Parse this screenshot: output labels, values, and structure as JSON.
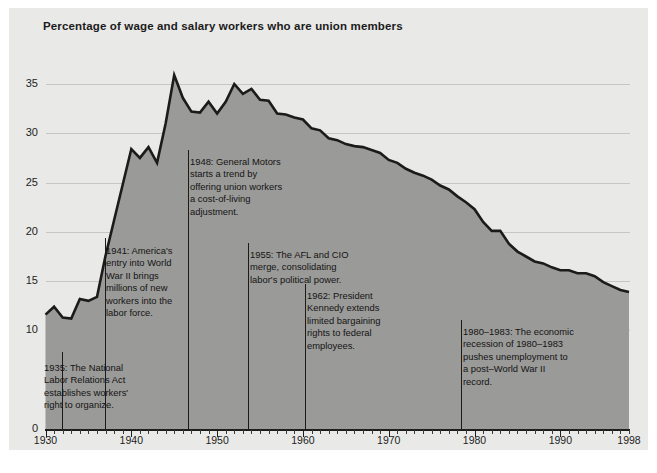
{
  "chart_data": {
    "type": "area",
    "title": "Percentage of wage and salary workers who are union members",
    "xlabel": "",
    "ylabel": "",
    "xlim": [
      1930,
      1998
    ],
    "ylim": [
      0,
      37
    ],
    "yticks": [
      0,
      10,
      15,
      20,
      25,
      30,
      35
    ],
    "ytick_labels": [
      "0",
      "10",
      "15",
      "20",
      "25",
      "30",
      "35"
    ],
    "xticks": [
      1930,
      1940,
      1950,
      1960,
      1970,
      1980,
      1990,
      1998
    ],
    "xtick_labels": [
      "1930",
      "1940",
      "1950",
      "1960",
      "1970",
      "1980",
      "1990",
      "1998"
    ],
    "grid": true,
    "legend": "none",
    "series_name": "Percent of wage and salary workers who are union members",
    "x": [
      1930,
      1931,
      1932,
      1933,
      1934,
      1935,
      1936,
      1937,
      1938,
      1939,
      1940,
      1941,
      1942,
      1943,
      1944,
      1945,
      1946,
      1947,
      1948,
      1949,
      1950,
      1951,
      1952,
      1953,
      1954,
      1955,
      1956,
      1957,
      1958,
      1959,
      1960,
      1961,
      1962,
      1963,
      1964,
      1965,
      1966,
      1967,
      1968,
      1969,
      1970,
      1971,
      1972,
      1973,
      1974,
      1975,
      1976,
      1977,
      1978,
      1979,
      1980,
      1981,
      1982,
      1983,
      1984,
      1985,
      1986,
      1987,
      1988,
      1989,
      1990,
      1991,
      1992,
      1993,
      1994,
      1995,
      1996,
      1997,
      1998
    ],
    "values": [
      11.6,
      12.4,
      11.3,
      11.2,
      13.2,
      13.0,
      13.4,
      17.6,
      21.2,
      24.8,
      28.4,
      27.5,
      28.6,
      27.0,
      31.0,
      35.9,
      33.6,
      32.2,
      32.1,
      33.2,
      32.0,
      33.2,
      35.0,
      34.0,
      34.5,
      33.4,
      33.3,
      32.0,
      31.9,
      31.6,
      31.4,
      30.5,
      30.3,
      29.5,
      29.3,
      28.9,
      28.7,
      28.6,
      28.3,
      28.0,
      27.3,
      27.0,
      26.4,
      26.0,
      25.7,
      25.3,
      24.7,
      24.3,
      23.6,
      23.0,
      22.3,
      21.0,
      20.1,
      20.1,
      18.8,
      18.0,
      17.5,
      17.0,
      16.8,
      16.4,
      16.1,
      16.1,
      15.8,
      15.8,
      15.5,
      14.9,
      14.5,
      14.1,
      13.9
    ],
    "peak": {
      "year": 1945,
      "value": 35.9
    },
    "end": {
      "year": 1998,
      "value": 13.9
    },
    "area_color": "#9a9a98",
    "line_color": "#1b1b1b",
    "background_color": "#e9e9e7",
    "grid_color": "#c6c6c2"
  },
  "annotations": [
    {
      "id": "ann-1935",
      "year": 1935,
      "text": "1935: The National\nLabor Relations Act\nestablishes workers'\nright to organize."
    },
    {
      "id": "ann-1941",
      "year": 1941,
      "text": "1941: America's\nentry into World\nWar II brings\nmillions of new\nworkers into the\nlabor force."
    },
    {
      "id": "ann-1948",
      "year": 1948,
      "text": "1948: General Motors\nstarts a trend by\noffering union workers\na cost-of-living\nadjustment."
    },
    {
      "id": "ann-1955",
      "year": 1955,
      "text": "1955: The AFL and CIO\nmerge, consolidating\nlabor's political power."
    },
    {
      "id": "ann-1962",
      "year": 1962,
      "text": "1962: President\nKennedy extends\nlimited bargaining\nrights to federal\nemployees."
    },
    {
      "id": "ann-1980",
      "year": 1980,
      "text": "1980–1983: The economic\nrecession of 1980–1983\npushes unemployment to\na post–World War II\nrecord."
    }
  ]
}
